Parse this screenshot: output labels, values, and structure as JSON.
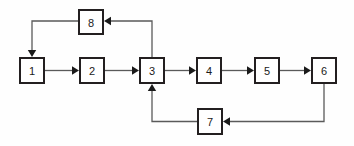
{
  "diagram": {
    "type": "block-flow-diagram",
    "canvas": {
      "width": 354,
      "height": 146,
      "background": "#fefefe"
    },
    "style": {
      "box_fill": "#ffffff",
      "box_stroke": "#231f20",
      "box_stroke_width": 2,
      "edge_stroke": "#5a5a5a",
      "arrowhead_fill": "#1a1a1a",
      "label_color": "#1a1a1a",
      "box_width": 26,
      "box_height": 27
    },
    "nodes": [
      {
        "id": "n1",
        "label": "1",
        "x": 19,
        "y": 57,
        "w": 26,
        "h": 27
      },
      {
        "id": "n2",
        "label": "2",
        "x": 79,
        "y": 57,
        "w": 26,
        "h": 27
      },
      {
        "id": "n3",
        "label": "3",
        "x": 139,
        "y": 57,
        "w": 26,
        "h": 27
      },
      {
        "id": "n4",
        "label": "4",
        "x": 196,
        "y": 57,
        "w": 26,
        "h": 27
      },
      {
        "id": "n5",
        "label": "5",
        "x": 254,
        "y": 57,
        "w": 26,
        "h": 27
      },
      {
        "id": "n6",
        "label": "6",
        "x": 311,
        "y": 57,
        "w": 26,
        "h": 27
      },
      {
        "id": "n7",
        "label": "7",
        "x": 197,
        "y": 108,
        "w": 26,
        "h": 27
      },
      {
        "id": "n8",
        "label": "8",
        "x": 78,
        "y": 9,
        "w": 26,
        "h": 26
      }
    ],
    "edges": [
      {
        "id": "e1",
        "from": "n1",
        "to": "n2",
        "kind": "straight",
        "points": "45,70.5 76,70.5",
        "head": {
          "x": 79,
          "y": 70.5,
          "dir": "right"
        }
      },
      {
        "id": "e2",
        "from": "n2",
        "to": "n3",
        "kind": "straight",
        "points": "105,70.5 136,70.5",
        "head": {
          "x": 139,
          "y": 70.5,
          "dir": "right"
        }
      },
      {
        "id": "e3",
        "from": "n3",
        "to": "n4",
        "kind": "straight",
        "points": "165,70.5 193,70.5",
        "head": {
          "x": 196,
          "y": 70.5,
          "dir": "right"
        }
      },
      {
        "id": "e4",
        "from": "n4",
        "to": "n5",
        "kind": "straight",
        "points": "222,70.5 251,70.5",
        "head": {
          "x": 254,
          "y": 70.5,
          "dir": "right"
        }
      },
      {
        "id": "e5",
        "from": "n5",
        "to": "n6",
        "kind": "straight",
        "points": "280,70.5 308,70.5",
        "head": {
          "x": 311,
          "y": 70.5,
          "dir": "right"
        }
      },
      {
        "id": "e6",
        "from": "n3",
        "to": "n8",
        "kind": "feedback-upper",
        "points": "152,57 152,21 107,21",
        "head": {
          "x": 104,
          "y": 21,
          "dir": "left"
        }
      },
      {
        "id": "e7",
        "from": "n8",
        "to": "n1",
        "kind": "feedback-upper-return",
        "points": "78,21 32,21 32,54",
        "head": {
          "x": 32,
          "y": 57,
          "dir": "down"
        }
      },
      {
        "id": "e8",
        "from": "n6",
        "to": "n7",
        "kind": "feedback-lower",
        "points": "324,84 324,121.5 226,121.5",
        "head": {
          "x": 223,
          "y": 121.5,
          "dir": "left"
        }
      },
      {
        "id": "e9",
        "from": "n7",
        "to": "n3",
        "kind": "feedback-lower-return",
        "points": "197,121.5 152,121.5 152,87",
        "head": {
          "x": 152,
          "y": 84,
          "dir": "up"
        }
      }
    ]
  }
}
